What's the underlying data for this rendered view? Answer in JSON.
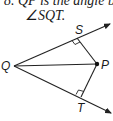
{
  "caption": {
    "line1": "8.  QP is the angle b",
    "line2": "∠SQT."
  },
  "diagram": {
    "points": {
      "Q": {
        "label": "Q",
        "x": 14,
        "y": 66
      },
      "P": {
        "label": "P",
        "x": 97,
        "y": 64
      },
      "S": {
        "label": "S",
        "x": 77,
        "y": 38
      },
      "T": {
        "label": "T",
        "x": 81,
        "y": 97
      }
    },
    "rays": [
      "QS",
      "QT"
    ],
    "segments": [
      "QP",
      "SP",
      "TP"
    ],
    "right_angles": [
      "S",
      "T"
    ],
    "colors": {
      "stroke": "#222222",
      "text": "#1a1a1a"
    }
  }
}
